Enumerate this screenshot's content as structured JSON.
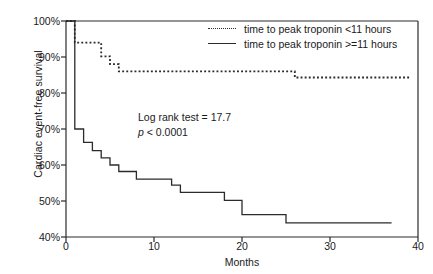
{
  "chart_data": {
    "type": "line",
    "subtype": "kaplan-meier-step",
    "title": "",
    "xlabel": "Months",
    "ylabel": "Cardiac event-free survival",
    "xlim": [
      0,
      40
    ],
    "ylim": [
      40,
      100
    ],
    "xticks": [
      0,
      10,
      20,
      30,
      40
    ],
    "xtick_labels": [
      "0",
      "10",
      "20",
      "30",
      "40"
    ],
    "yticks": [
      40,
      50,
      60,
      70,
      80,
      90,
      100
    ],
    "ytick_labels": [
      "40%",
      "50%",
      "60%",
      "70%",
      "80%",
      "90%",
      "100%"
    ],
    "grid": false,
    "legend_position": "top-right",
    "annotations": [
      {
        "text": "Log rank test = 17.7",
        "italic_prefix": ""
      },
      {
        "text": "p < 0.0001",
        "italic_prefix": "p"
      }
    ],
    "series": [
      {
        "name": "time to peak troponin <11 hours",
        "style": "dotted",
        "color": "#2b2b2b",
        "points": [
          [
            0,
            100
          ],
          [
            1,
            100
          ],
          [
            1,
            94
          ],
          [
            4,
            94
          ],
          [
            4,
            90.2
          ],
          [
            5,
            90.2
          ],
          [
            5,
            88
          ],
          [
            6,
            88
          ],
          [
            6,
            86
          ],
          [
            26,
            86
          ],
          [
            26,
            84.3
          ],
          [
            39,
            84.3
          ]
        ]
      },
      {
        "name": "time to peak troponin >=11 hours",
        "style": "solid",
        "color": "#2b2b2b",
        "points": [
          [
            0,
            100
          ],
          [
            1,
            100
          ],
          [
            1,
            70
          ],
          [
            2,
            70
          ],
          [
            2,
            66.3
          ],
          [
            3,
            66.3
          ],
          [
            3,
            64
          ],
          [
            4,
            64
          ],
          [
            4,
            62
          ],
          [
            5,
            62
          ],
          [
            5,
            60
          ],
          [
            6,
            60
          ],
          [
            6,
            58.2
          ],
          [
            8,
            58.2
          ],
          [
            8,
            56.1
          ],
          [
            12,
            56.1
          ],
          [
            12,
            54.4
          ],
          [
            13,
            54.4
          ],
          [
            13,
            52.4
          ],
          [
            18,
            52.4
          ],
          [
            18,
            50.2
          ],
          [
            20,
            50.2
          ],
          [
            20,
            46.2
          ],
          [
            25,
            46.2
          ],
          [
            25,
            43.9
          ],
          [
            37,
            43.9
          ]
        ]
      }
    ]
  },
  "legend": {
    "items": [
      {
        "label": "time to peak troponin <11 hours",
        "style": "dotted"
      },
      {
        "label": "time to peak troponin >=11 hours",
        "style": "solid"
      }
    ]
  },
  "annotation": {
    "line1": "Log rank test = 17.7",
    "p_symbol": "p",
    "p_rest": " < 0.0001"
  },
  "colors": {
    "axis": "#2b2b2b",
    "curve": "#2b2b2b",
    "text": "#1a1a1a",
    "background": "#ffffff"
  }
}
